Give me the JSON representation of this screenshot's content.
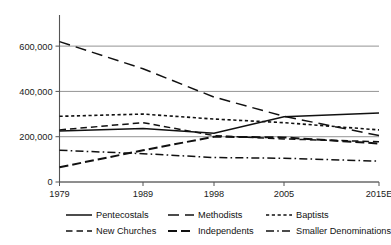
{
  "chart_data": {
    "type": "line",
    "title": "",
    "xlabel": "",
    "ylabel": "",
    "x": [
      "1979",
      "1989",
      "1998",
      "2005",
      "2015E"
    ],
    "categories": [
      "1979",
      "1989",
      "1998",
      "2005",
      "2015E"
    ],
    "ylim": [
      0,
      680000
    ],
    "yticks": [
      0,
      200000,
      400000,
      600000
    ],
    "ytick_labels": [
      "0",
      "200,000",
      "400,000",
      "600,000"
    ],
    "xtick_labels": [
      "1979",
      "1989",
      "1998",
      "2005",
      "2015E"
    ],
    "grid": true,
    "legend_position": "bottom",
    "series": [
      {
        "name": "Pentecostals",
        "style": "solid",
        "values": [
          225000,
          236000,
          215000,
          288000,
          305000
        ]
      },
      {
        "name": "Methodists",
        "style": "long-dash",
        "values": [
          620000,
          500000,
          375000,
          290000,
          205000
        ]
      },
      {
        "name": "Baptists",
        "style": "dotted",
        "values": [
          290000,
          300000,
          278000,
          262000,
          230000
        ]
      },
      {
        "name": "New Churches",
        "style": "dashed",
        "values": [
          230000,
          262000,
          205000,
          190000,
          178000
        ]
      },
      {
        "name": "Independents",
        "style": "long-dash-heavy",
        "values": [
          65000,
          140000,
          200000,
          197000,
          170000
        ]
      },
      {
        "name": "Smaller Denominations",
        "style": "dash-dot",
        "values": [
          140000,
          125000,
          108000,
          105000,
          92000
        ]
      }
    ]
  },
  "legend": {
    "entries": [
      {
        "label": "Pentecostals",
        "style": "solid"
      },
      {
        "label": "Methodists",
        "style": "long-dash"
      },
      {
        "label": "Baptists",
        "style": "dotted"
      },
      {
        "label": "New Churches",
        "style": "dashed"
      },
      {
        "label": "Independents",
        "style": "long-dash-heavy"
      },
      {
        "label": "Smaller Denominations",
        "style": "dash-dot"
      }
    ]
  },
  "colors": {
    "ink": "#111111",
    "grid": "#888888",
    "axis": "#555555",
    "background": "#ffffff"
  }
}
